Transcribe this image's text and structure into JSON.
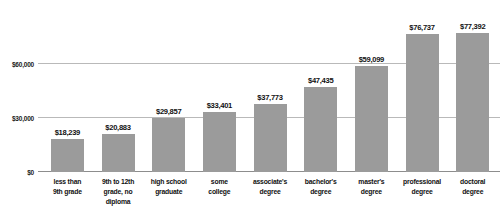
{
  "chart_data": {
    "type": "bar",
    "title": "",
    "subtitle": "",
    "xlabel": "",
    "ylabel": "",
    "ylim": [
      0,
      90000
    ],
    "grid": true,
    "legend": "none",
    "orientation": "vertical",
    "bar_color": "#9b9b9b",
    "categories": [
      "less than\n9th grade",
      "9th to 12th\ngrade, no\ndiploma",
      "high school\ngraduate",
      "some\ncollege",
      "associate's\ndegree",
      "bachelor's\ndegree",
      "master's\ndegree",
      "professional\ndegree",
      "doctoral\ndegree"
    ],
    "values": [
      18239,
      20883,
      29857,
      33401,
      37773,
      47435,
      59099,
      76737,
      77392
    ],
    "value_labels": [
      "$18,239",
      "$20,883",
      "$29,857",
      "$33,401",
      "$37,773",
      "$47,435",
      "$59,099",
      "$76,737",
      "$77,392"
    ],
    "yticks": [
      0,
      30000,
      60000
    ],
    "ytick_labels": [
      "$0",
      "$30,000",
      "$60,000"
    ]
  },
  "axis": {
    "y": {
      "ticks": [
        {
          "label": "$60,000",
          "value": 60000
        },
        {
          "label": "$30,000",
          "value": 30000
        },
        {
          "label": "$0",
          "value": 0
        }
      ]
    }
  },
  "bars": [
    {
      "label": "less than\n9th grade",
      "value_label": "$18,239",
      "value": 18239
    },
    {
      "label": "9th to 12th\ngrade, no\ndiploma",
      "value_label": "$20,883",
      "value": 20883
    },
    {
      "label": "high school\ngraduate",
      "value_label": "$29,857",
      "value": 29857
    },
    {
      "label": "some\ncollege",
      "value_label": "$33,401",
      "value": 33401
    },
    {
      "label": "associate's\ndegree",
      "value_label": "$37,773",
      "value": 37773
    },
    {
      "label": "bachelor's\ndegree",
      "value_label": "$47,435",
      "value": 47435
    },
    {
      "label": "master's\ndegree",
      "value_label": "$59,099",
      "value": 59099
    },
    {
      "label": "professional\ndegree",
      "value_label": "$76,737",
      "value": 76737
    },
    {
      "label": "doctoral\ndegree",
      "value_label": "$77,392",
      "value": 77392
    }
  ],
  "colors": {
    "bar": "#9b9b9b",
    "gridline": "#b9b9b9",
    "baseline": "#8d8d8d",
    "text": "#111111",
    "background": "#ffffff"
  }
}
